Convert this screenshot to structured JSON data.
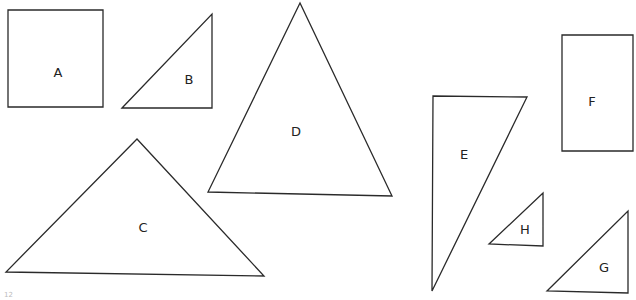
{
  "figure": {
    "shapes": [
      {
        "id": "A",
        "type": "square",
        "label": "A",
        "points": "8,10 103,10 103,107 8,107",
        "label_pos": [
          58,
          73
        ]
      },
      {
        "id": "B",
        "type": "right-triangle",
        "label": "B",
        "points": "122,108 212,14 212,108",
        "label_pos": [
          189,
          80
        ]
      },
      {
        "id": "C",
        "type": "triangle",
        "label": "C",
        "points": "137,139 6,272 264,276",
        "label_pos": [
          143,
          228
        ]
      },
      {
        "id": "D",
        "type": "triangle",
        "label": "D",
        "points": "300,3 208,192 392,196",
        "label_pos": [
          296,
          132
        ]
      },
      {
        "id": "E",
        "type": "right-triangle",
        "label": "E",
        "points": "433,96 527,97 432,291",
        "label_pos": [
          464,
          155
        ]
      },
      {
        "id": "F",
        "type": "rectangle",
        "label": "F",
        "points": "562,35 633,35 633,151 562,151",
        "label_pos": [
          592,
          102
        ]
      },
      {
        "id": "G",
        "type": "right-triangle",
        "label": "G",
        "points": "547,291 628,211 628,293",
        "label_pos": [
          604,
          268
        ]
      },
      {
        "id": "H",
        "type": "right-triangle",
        "label": "H",
        "points": "489,244 543,193 543,246",
        "label_pos": [
          525,
          230
        ]
      }
    ],
    "page_mark": "12",
    "stroke_color": "#2a2a2a",
    "background": "#ffffff"
  }
}
